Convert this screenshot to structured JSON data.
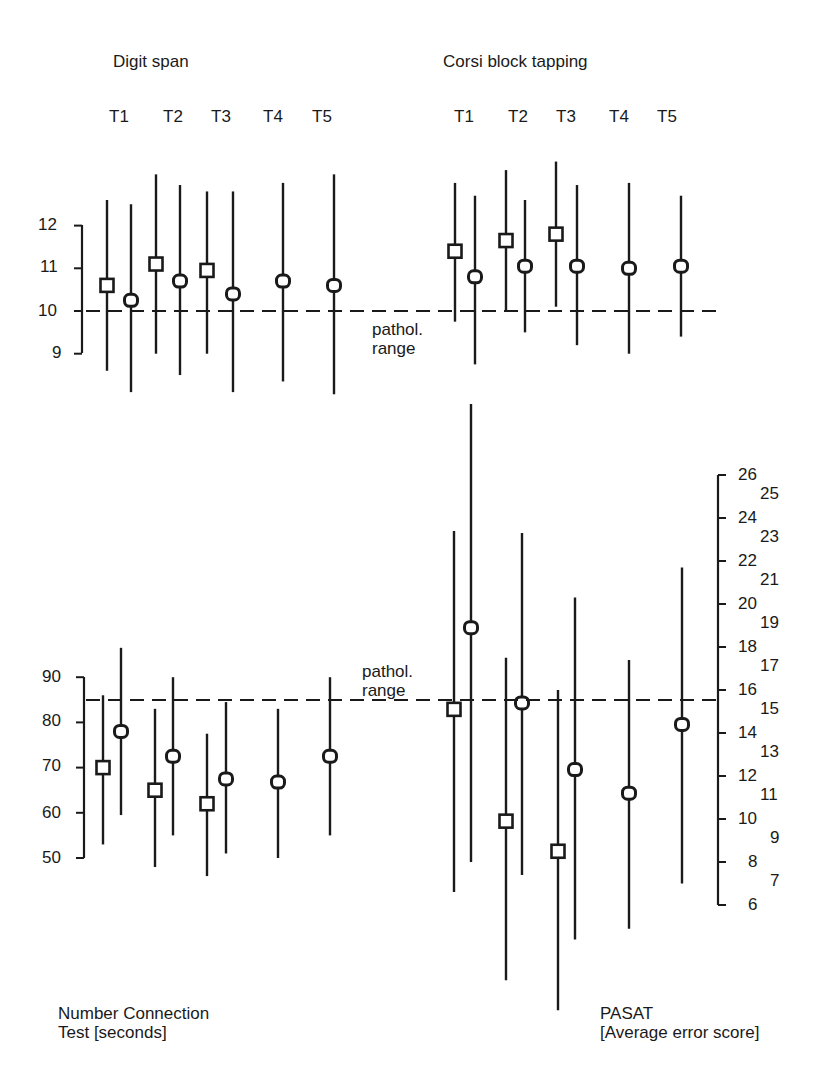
{
  "chart_data": [
    {
      "type": "scatter",
      "subtype": "mean-with-range-bars",
      "title": "Digit span",
      "panel": "top-left",
      "categories": [
        "T1",
        "T2",
        "T3",
        "T4",
        "T5"
      ],
      "ylabel": "",
      "ylim": [
        9,
        12
      ],
      "yticks": [
        9,
        10,
        11,
        12
      ],
      "reference_line": {
        "value": 10,
        "style": "dashed",
        "label": "pathol. range"
      },
      "series": [
        {
          "name": "square markers",
          "marker": "square",
          "x": [
            "T1",
            "T2",
            "T3"
          ],
          "values": [
            10.6,
            11.1,
            10.95
          ],
          "upper": [
            12.6,
            13.2,
            12.8
          ],
          "lower": [
            8.6,
            9.0,
            9.0
          ]
        },
        {
          "name": "circle markers",
          "marker": "circle",
          "x": [
            "T1",
            "T2",
            "T3",
            "T4",
            "T5"
          ],
          "values": [
            10.25,
            10.7,
            10.4,
            10.7,
            10.6
          ],
          "upper": [
            12.5,
            12.95,
            12.8,
            13.0,
            13.2
          ],
          "lower": [
            8.1,
            8.5,
            8.1,
            8.35,
            8.05
          ]
        }
      ]
    },
    {
      "type": "scatter",
      "subtype": "mean-with-range-bars",
      "title": "Corsi block tapping",
      "panel": "top-right",
      "categories": [
        "T1",
        "T2",
        "T3",
        "T4",
        "T5"
      ],
      "ylim": [
        9,
        12
      ],
      "reference_line": {
        "value": 10,
        "style": "dashed",
        "label": "pathol. range"
      },
      "series": [
        {
          "name": "square markers",
          "marker": "square",
          "x": [
            "T1",
            "T2",
            "T3"
          ],
          "values": [
            11.4,
            11.65,
            11.8
          ],
          "upper": [
            13.0,
            13.3,
            13.5
          ],
          "lower": [
            9.75,
            10.0,
            10.1
          ]
        },
        {
          "name": "circle markers",
          "marker": "circle",
          "x": [
            "T1",
            "T2",
            "T3",
            "T4",
            "T5"
          ],
          "values": [
            10.8,
            11.05,
            11.05,
            11.0,
            11.05
          ],
          "upper": [
            12.7,
            12.6,
            12.95,
            13.0,
            12.7
          ],
          "lower": [
            8.75,
            9.5,
            9.2,
            9.0,
            9.4
          ]
        }
      ]
    },
    {
      "type": "scatter",
      "subtype": "mean-with-range-bars",
      "title": "Number Connection Test [seconds]",
      "panel": "bottom-left",
      "categories": [
        "T1",
        "T2",
        "T3",
        "T4",
        "T5"
      ],
      "ylim": [
        50,
        90
      ],
      "yticks": [
        50,
        60,
        70,
        80,
        90
      ],
      "reference_line": {
        "value": 85,
        "style": "dashed",
        "label": "pathol. range"
      },
      "series": [
        {
          "name": "square markers",
          "marker": "square",
          "x": [
            "T1",
            "T2",
            "T3"
          ],
          "values": [
            70,
            65,
            62
          ],
          "upper": [
            86,
            83,
            77.5
          ],
          "lower": [
            53,
            48,
            46
          ]
        },
        {
          "name": "circle markers",
          "marker": "circle",
          "x": [
            "T1",
            "T2",
            "T3",
            "T4",
            "T5"
          ],
          "values": [
            78,
            72.5,
            67.5,
            66.8,
            72.5
          ],
          "upper": [
            96.5,
            90,
            84.5,
            83,
            90
          ],
          "lower": [
            59.5,
            55,
            51,
            50,
            55
          ]
        }
      ]
    },
    {
      "type": "scatter",
      "subtype": "mean-with-range-bars",
      "title": "PASAT [Average error score]",
      "panel": "bottom-right",
      "categories": [
        "T1",
        "T2",
        "T3",
        "T4",
        "T5"
      ],
      "ylim": [
        6,
        26
      ],
      "yticks": [
        6,
        7,
        8,
        9,
        10,
        11,
        12,
        13,
        14,
        15,
        16,
        17,
        18,
        19,
        20,
        21,
        22,
        23,
        24,
        25,
        26
      ],
      "axis_position": "right",
      "reference_line": {
        "value": 15.5,
        "style": "dashed",
        "label": "pathol. range"
      },
      "series": [
        {
          "name": "square markers",
          "marker": "square",
          "x": [
            "T1",
            "T2",
            "T3"
          ],
          "values": [
            15.1,
            9.9,
            8.5
          ],
          "upper": [
            23.4,
            17.5,
            16.0
          ],
          "lower": [
            6.6,
            2.5,
            1.1
          ]
        },
        {
          "name": "circle markers",
          "marker": "circle",
          "x": [
            "T1",
            "T2",
            "T3",
            "T4",
            "T5"
          ],
          "values": [
            18.9,
            15.4,
            12.3,
            11.2,
            14.4
          ],
          "upper": [
            29.3,
            23.3,
            20.3,
            17.4,
            21.7
          ],
          "lower": [
            8.0,
            7.4,
            4.4,
            4.9,
            7.0
          ]
        }
      ]
    }
  ],
  "labels": {
    "top_left_title": "Digit span",
    "top_right_title": "Corsi block tapping",
    "time_points": [
      "T1",
      "T2",
      "T3",
      "T4",
      "T5"
    ],
    "pathol_line1": "pathol.",
    "pathol_line2": "range",
    "nct_line1": "Number Connection",
    "nct_line2": "Test [seconds]",
    "pasat_line1": "PASAT",
    "pasat_line2": "[Average error score]",
    "digit_ticks": [
      "12",
      "11",
      "10",
      "9"
    ],
    "nct_ticks": [
      "90",
      "80",
      "70",
      "60",
      "50"
    ],
    "pasat_ticks_even": [
      "26",
      "24",
      "22",
      "20",
      "18",
      "16",
      "14",
      "12",
      "10",
      "8",
      "6"
    ],
    "pasat_ticks_odd": [
      "25",
      "23",
      "21",
      "19",
      "17",
      "15",
      "13",
      "11",
      "9",
      "7"
    ]
  },
  "colors": {
    "ink": "#1a1a1a",
    "background": "#ffffff"
  }
}
